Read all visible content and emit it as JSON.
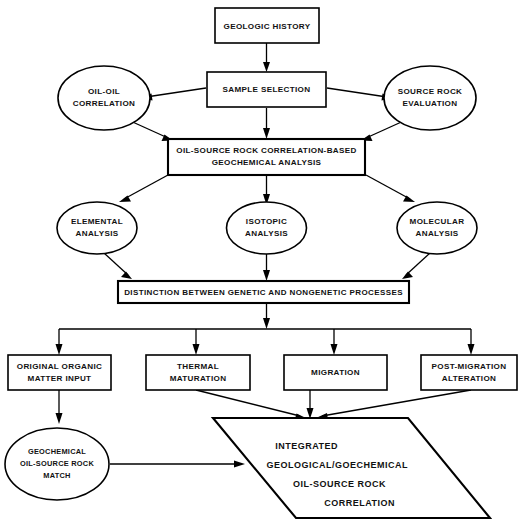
{
  "diagram": {
    "colors": {
      "background": "#ffffff",
      "stroke": "#000000",
      "text": "#111111"
    },
    "nodes": {
      "geologic_history": {
        "label": "GEOLOGIC HISTORY",
        "shape": "rectangle"
      },
      "sample_selection": {
        "label": "SAMPLE SELECTION",
        "shape": "rectangle"
      },
      "oil_oil_correlation": {
        "shape": "ellipse",
        "lines": [
          "OIL-OIL",
          "CORRELATION"
        ]
      },
      "source_rock_evaluation": {
        "shape": "ellipse",
        "lines": [
          "SOURCE ROCK",
          "EVALUATION"
        ]
      },
      "geochemical_analysis": {
        "shape": "rectangle",
        "lines": [
          "OIL-SOURCE ROCK CORRELATION-BASED",
          "GEOCHEMICAL ANALYSIS"
        ]
      },
      "elemental_analysis": {
        "shape": "ellipse",
        "lines": [
          "ELEMENTAL",
          "ANALYSIS"
        ]
      },
      "isotopic_analysis": {
        "shape": "ellipse",
        "lines": [
          "ISOTOPIC",
          "ANALYSIS"
        ]
      },
      "molecular_analysis": {
        "shape": "ellipse",
        "lines": [
          "MOLECULAR",
          "ANALYSIS"
        ]
      },
      "distinction_bar": {
        "shape": "rectangle",
        "label": "DISTINCTION BETWEEN GENETIC AND NONGENETIC  PROCESSES"
      },
      "original_organic_matter_input": {
        "shape": "rectangle",
        "lines": [
          "ORIGINAL ORGANIC",
          "MATTER INPUT"
        ]
      },
      "thermal_maturation": {
        "shape": "rectangle",
        "lines": [
          "THERMAL",
          "MATURATION"
        ]
      },
      "migration": {
        "shape": "rectangle",
        "lines": [
          "MIGRATION"
        ]
      },
      "post_migration_alteration": {
        "shape": "rectangle",
        "lines": [
          "POST-MIGRATION",
          "ALTERATION"
        ]
      },
      "geochemical_match": {
        "shape": "ellipse",
        "lines": [
          "GEOCHEMICAL",
          "OIL-SOURCE ROCK",
          "MATCH"
        ]
      },
      "integrated_correlation": {
        "shape": "parallelogram",
        "lines": [
          "INTEGRATED",
          "GEOLOGICAL/GOECHEMICAL",
          "OIL-SOURCE ROCK",
          "CORRELATION"
        ]
      }
    }
  }
}
